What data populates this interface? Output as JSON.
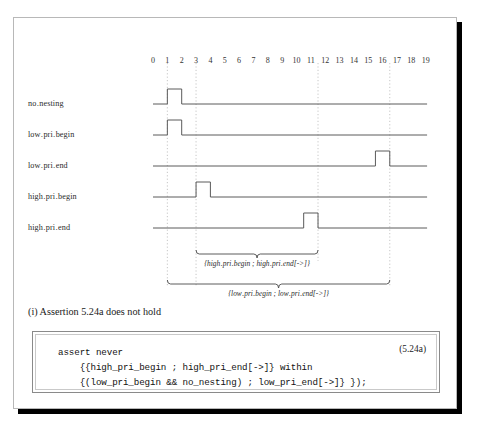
{
  "figure": {
    "caption": "(i) Assertion 5.24a does not hold",
    "equation_number": "(5.24a)"
  },
  "timing_diagram": {
    "signals": [
      {
        "name": "no_nesting",
        "label": "no․nesting"
      },
      {
        "name": "low_pri_begin",
        "label": "low․pri․begin"
      },
      {
        "name": "low_pri_end",
        "label": "low․pri․end"
      },
      {
        "name": "high_pri_begin",
        "label": "high․pri․begin"
      },
      {
        "name": "high_pri_end",
        "label": "high․pri․end"
      }
    ],
    "tick_labels": [
      "0",
      "1",
      "2",
      "3",
      "4",
      "5",
      "6",
      "7",
      "8",
      "9",
      "10",
      "11",
      "12",
      "13",
      "14",
      "15",
      "16",
      "17",
      "18",
      "19"
    ],
    "axis_range": [
      0,
      19
    ],
    "marker_lines": [
      1,
      3,
      11.5,
      16.5
    ],
    "pulses": {
      "no_nesting": [
        {
          "start": 1,
          "end": 2
        }
      ],
      "low_pri_begin": [
        {
          "start": 1,
          "end": 2
        }
      ],
      "low_pri_end": [
        {
          "start": 15.5,
          "end": 16.5
        }
      ],
      "high_pri_begin": [
        {
          "start": 3,
          "end": 4
        }
      ],
      "high_pri_end": [
        {
          "start": 10.5,
          "end": 11.5
        }
      ]
    },
    "brace_annotations": [
      {
        "name": "high-pri-sequence",
        "text": "{high․pri․begin ; high․pri․end[->]}",
        "from": 3,
        "to": 11.5
      },
      {
        "name": "low-pri-sequence",
        "text": "{low․pri․begin ; low․pri․end[->]}",
        "from": 1,
        "to": 16.5
      }
    ],
    "colors": {
      "waveform": "#5a5a5a",
      "marker": "#c0c0c0",
      "text": "#2b2b2b"
    }
  },
  "code_block": {
    "lines": [
      "assert never",
      "    {{high_pri_begin ; high_pri_end[->]} within",
      "    {(low_pri_begin && no_nesting) ; low_pri_end[->]} });"
    ]
  }
}
